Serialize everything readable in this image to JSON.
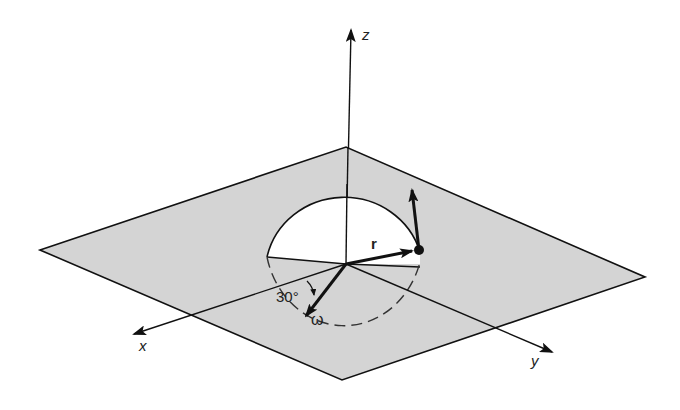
{
  "diagram": {
    "colors": {
      "background": "#ffffff",
      "plane_fill": "#d4d4d4",
      "line": "#111111",
      "half_disk_fill": "#ffffff"
    },
    "axes": {
      "x": {
        "label": "x"
      },
      "y": {
        "label": "y"
      },
      "z": {
        "label": "z"
      }
    },
    "vectors": {
      "position": {
        "label": "r"
      },
      "angular_velocity": {
        "label": "ω"
      },
      "velocity": {
        "label": ""
      }
    },
    "angle": {
      "label": "30°"
    }
  }
}
